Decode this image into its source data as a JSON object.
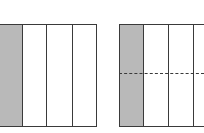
{
  "diagram": {
    "colors": {
      "shade": "#b9b9b9",
      "line": "#3a3a3a",
      "background": "#ffffff"
    },
    "figures": [
      {
        "name": "left-bar",
        "columns": 4,
        "shaded_columns": 1,
        "rows": 1,
        "dashed_divider": false,
        "fraction": "1/4"
      },
      {
        "name": "right-bar",
        "columns": 4,
        "shaded_columns": 1,
        "rows": 2,
        "dashed_divider": true,
        "fraction": "2/8"
      }
    ]
  }
}
